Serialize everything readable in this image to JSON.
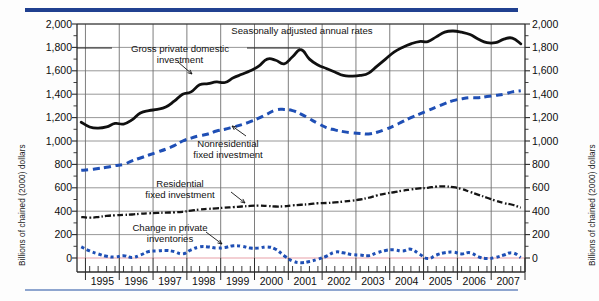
{
  "figure": {
    "y_axis_label_left": "Billions of chained (2000) dollars",
    "y_axis_label_right": "Billions of chained (2000) dollars",
    "note": "Seasonally adjusted annual rates",
    "rule_color_top": "#1f3f8f",
    "rule_color_bottom": "#8ea5cf"
  },
  "annotations": {
    "gross": "Gross private domestic\ninvestment",
    "gross_line1": "Gross private domestic",
    "gross_line2": "investment",
    "nonres_line1": "Nonresidential",
    "nonres_line2": "fixed investment",
    "res_line1": "Residential",
    "res_line2": "fixed investment",
    "inv_line1": "Change in private",
    "inv_line2": "inventories"
  },
  "chart_data": {
    "type": "line",
    "title": "",
    "subtitle": "Seasonally adjusted annual rates",
    "xlabel": "",
    "ylabel": "Billions of chained (2000) dollars",
    "ylim": [
      0,
      2000
    ],
    "ytick_step": 200,
    "yticks": [
      0,
      200,
      400,
      600,
      800,
      1000,
      1200,
      1400,
      1600,
      1800,
      2000
    ],
    "ytick_labels": [
      "0",
      "200",
      "400",
      "600",
      "800",
      "1,000",
      "1,200",
      "1,400",
      "1,600",
      "1,800",
      "2,000"
    ],
    "minor_ytick_step": 100,
    "grid": true,
    "grid_axis": "both",
    "legend": "inline-annotations",
    "xlim": [
      1994.75,
      2008.0
    ],
    "xtick_labels": [
      "1995",
      "1996",
      "1997",
      "1998",
      "1999",
      "2000",
      "2001",
      "2002",
      "2003",
      "2004",
      "2005",
      "2006",
      "2007"
    ],
    "x_minor": "quarterly",
    "zero_line_color": "#e8a0a8",
    "x": [
      1994.875,
      1995.125,
      1995.375,
      1995.625,
      1995.875,
      1996.125,
      1996.375,
      1996.625,
      1996.875,
      1997.125,
      1997.375,
      1997.625,
      1997.875,
      1998.125,
      1998.375,
      1998.625,
      1998.875,
      1999.125,
      1999.375,
      1999.625,
      1999.875,
      2000.125,
      2000.375,
      2000.625,
      2000.875,
      2001.125,
      2001.375,
      2001.625,
      2001.875,
      2002.125,
      2002.375,
      2002.625,
      2002.875,
      2003.125,
      2003.375,
      2003.625,
      2003.875,
      2004.125,
      2004.375,
      2004.625,
      2004.875,
      2005.125,
      2005.375,
      2005.625,
      2005.875,
      2006.125,
      2006.375,
      2006.625,
      2006.875,
      2007.125,
      2007.375,
      2007.625,
      2007.875
    ],
    "series": [
      {
        "name": "Gross private domestic investment",
        "style": "solid-thick",
        "color": "#101010",
        "values": [
          1160,
          1120,
          1110,
          1120,
          1150,
          1145,
          1180,
          1240,
          1260,
          1270,
          1290,
          1340,
          1400,
          1420,
          1480,
          1490,
          1505,
          1500,
          1540,
          1570,
          1600,
          1640,
          1700,
          1690,
          1660,
          1720,
          1780,
          1700,
          1650,
          1620,
          1590,
          1560,
          1555,
          1560,
          1580,
          1640,
          1700,
          1760,
          1800,
          1830,
          1850,
          1850,
          1890,
          1930,
          1940,
          1930,
          1910,
          1870,
          1840,
          1840,
          1870,
          1880,
          1830
        ]
      },
      {
        "name": "Nonresidential fixed investment",
        "style": "dashed-thick",
        "color": "#1f4fb5",
        "values": [
          750,
          755,
          765,
          775,
          790,
          800,
          830,
          855,
          880,
          905,
          930,
          960,
          1000,
          1025,
          1045,
          1060,
          1085,
          1100,
          1120,
          1140,
          1165,
          1195,
          1230,
          1265,
          1270,
          1260,
          1230,
          1190,
          1150,
          1115,
          1095,
          1080,
          1070,
          1065,
          1060,
          1075,
          1100,
          1130,
          1165,
          1200,
          1230,
          1260,
          1290,
          1320,
          1345,
          1360,
          1370,
          1370,
          1380,
          1390,
          1400,
          1420,
          1430
        ]
      },
      {
        "name": "Residential fixed investment",
        "style": "dash-dot",
        "color": "#151515",
        "values": [
          350,
          345,
          350,
          360,
          365,
          368,
          372,
          378,
          382,
          385,
          388,
          390,
          395,
          405,
          415,
          420,
          425,
          430,
          435,
          440,
          445,
          448,
          445,
          440,
          442,
          450,
          455,
          460,
          468,
          470,
          475,
          482,
          490,
          500,
          515,
          535,
          550,
          562,
          575,
          585,
          595,
          600,
          610,
          612,
          605,
          590,
          565,
          540,
          515,
          490,
          470,
          455,
          430
        ]
      },
      {
        "name": "Change in private inventories",
        "style": "dotted-square",
        "color": "#1f4fb5",
        "values": [
          95,
          60,
          35,
          15,
          8,
          20,
          5,
          25,
          55,
          60,
          65,
          55,
          35,
          70,
          95,
          95,
          85,
          90,
          105,
          100,
          85,
          85,
          95,
          75,
          20,
          -25,
          -40,
          -30,
          -10,
          15,
          50,
          45,
          30,
          25,
          20,
          45,
          65,
          70,
          60,
          75,
          35,
          -5,
          25,
          45,
          50,
          35,
          45,
          10,
          -5,
          5,
          25,
          45,
          5
        ]
      }
    ]
  }
}
